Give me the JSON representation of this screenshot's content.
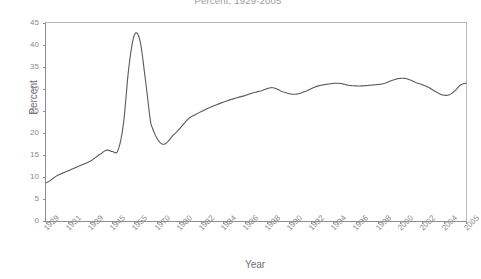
{
  "chart_data": {
    "type": "line",
    "title": "Percent, 1929-2005",
    "xlabel": "Year",
    "ylabel": "Percent",
    "ylim": [
      0,
      45
    ],
    "ytick_values": [
      0,
      5,
      10,
      15,
      20,
      25,
      30,
      35,
      40,
      45
    ],
    "grid": false,
    "legend": "none",
    "line_color": "#595959",
    "axis_color": "#8e8e93",
    "frame_color": "#b9b9bd",
    "categories": [
      "1929",
      "1931",
      "1939",
      "1945",
      "1955",
      "1970",
      "1980",
      "1982",
      "1984",
      "1986",
      "1988",
      "1990",
      "1992",
      "1994",
      "1996",
      "1998",
      "2000",
      "2002",
      "2004",
      "2005"
    ],
    "series": [
      {
        "name": "Percent",
        "x": [
          1929,
          1931,
          1933,
          1935,
          1937,
          1939,
          1940,
          1941,
          1942,
          1943,
          1944,
          1945,
          1946,
          1947,
          1948,
          1950,
          1952,
          1955,
          1960,
          1965,
          1968,
          1970,
          1972,
          1974,
          1976,
          1978,
          1980,
          1982,
          1984,
          1986,
          1988,
          1990,
          1992,
          1993,
          1994,
          1995,
          1996,
          1998,
          2000,
          2001,
          2002,
          2003,
          2004,
          2005
        ],
        "values": [
          8.7,
          10.3,
          11.4,
          12.5,
          13.6,
          15.3,
          16.1,
          15.8,
          16.0,
          22.0,
          35.0,
          42.3,
          41.0,
          32.0,
          22.0,
          17.5,
          19.5,
          23.5,
          26.5,
          28.5,
          29.6,
          30.3,
          29.3,
          28.8,
          29.5,
          30.6,
          31.1,
          31.3,
          30.8,
          30.7,
          30.9,
          31.2,
          32.1,
          32.4,
          32.4,
          32.0,
          31.4,
          30.5,
          29.1,
          28.6,
          28.7,
          29.6,
          30.9,
          31.3
        ]
      }
    ],
    "annotations": [
      "Peak of 42.3 percent occurs in 1944-1945 (World War II).",
      "Trough of 17.5 percent occurs around 1950.",
      "Series plateaus near 31 percent from 1980 onward."
    ]
  }
}
